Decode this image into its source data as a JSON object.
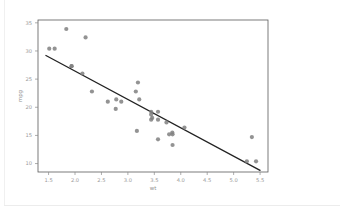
{
  "figure": {
    "background_color": "#ffffff",
    "plot_area": {
      "left": 38,
      "top": 20,
      "right": 268,
      "bottom": 172
    }
  },
  "chrome": {
    "left_rule_name": "page-left-rule",
    "bottom_rule_name": "page-bottom-rule"
  },
  "chart_data": {
    "type": "scatter",
    "title": "",
    "subtitle": "",
    "xlabel": "wt",
    "ylabel": "mpg",
    "xlim": [
      1.3,
      5.65
    ],
    "ylim": [
      8.5,
      35.5
    ],
    "xticks": [
      1.5,
      2.0,
      2.5,
      3.0,
      3.5,
      4.0,
      4.5,
      5.0,
      5.5
    ],
    "xticklabels": [
      "1.5",
      "2.0",
      "2.5",
      "3.0",
      "3.5",
      "4.0",
      "4.5",
      "5.0",
      "5.5"
    ],
    "yticks": [
      10,
      15,
      20,
      25,
      30,
      35
    ],
    "yticklabels": [
      "10",
      "15",
      "20",
      "25",
      "30",
      "35"
    ],
    "grid": false,
    "legend": null,
    "marker": {
      "shape": "circle",
      "color": "#808080",
      "size_px": 2.1,
      "opacity": 0.85
    },
    "x": [
      2.62,
      2.875,
      2.32,
      3.215,
      3.44,
      3.46,
      3.57,
      3.19,
      3.15,
      3.44,
      3.44,
      4.07,
      3.73,
      3.78,
      5.25,
      5.424,
      5.345,
      2.2,
      1.615,
      1.835,
      1.935,
      3.845,
      3.57,
      3.84,
      3.845,
      1.935,
      2.14,
      1.513,
      3.17,
      2.77,
      3.57,
      2.78
    ],
    "y": [
      21.0,
      21.0,
      22.8,
      21.4,
      18.7,
      18.1,
      14.3,
      24.4,
      22.8,
      19.2,
      17.8,
      16.4,
      17.3,
      15.2,
      10.4,
      10.4,
      14.7,
      32.4,
      30.4,
      33.9,
      27.3,
      15.2,
      19.2,
      15.5,
      13.3,
      27.3,
      26.0,
      30.4,
      15.8,
      19.7,
      17.8,
      21.4
    ],
    "series": [
      {
        "name": "mtcars",
        "x": [
          2.62,
          2.875,
          2.32,
          3.215,
          3.44,
          3.46,
          3.57,
          3.19,
          3.15,
          3.44,
          3.44,
          4.07,
          3.73,
          3.78,
          5.25,
          5.424,
          5.345,
          2.2,
          1.615,
          1.835,
          1.935,
          3.845,
          3.57,
          3.84,
          3.845,
          1.935,
          2.14,
          1.513,
          3.17,
          2.77,
          3.57,
          2.78
        ],
        "values": [
          21.0,
          21.0,
          22.8,
          21.4,
          18.7,
          18.1,
          14.3,
          24.4,
          22.8,
          19.2,
          17.8,
          16.4,
          17.3,
          15.2,
          10.4,
          10.4,
          14.7,
          32.4,
          30.4,
          33.9,
          27.3,
          15.2,
          19.2,
          15.5,
          13.3,
          27.3,
          26.0,
          30.4,
          15.8,
          19.7,
          17.8,
          21.4
        ]
      }
    ],
    "fit_line": {
      "name": "linear-regression",
      "type": "line",
      "color": "#222222",
      "width_px": 1.3,
      "x": [
        1.45,
        5.5
      ],
      "y": [
        29.2,
        8.8
      ],
      "slope": -5.04,
      "intercept": 36.5
    }
  }
}
